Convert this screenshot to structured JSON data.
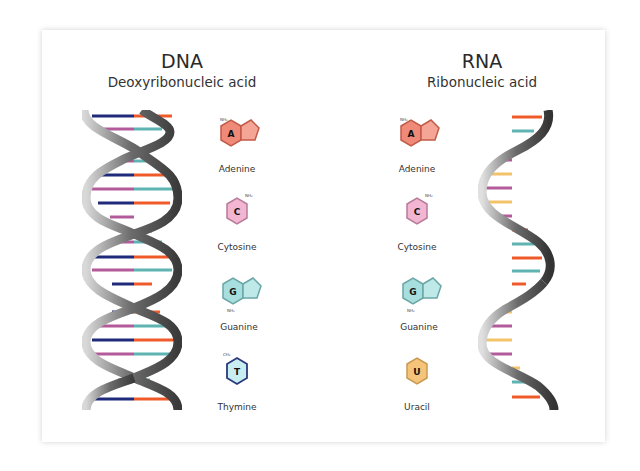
{
  "dna": {
    "title": "DNA",
    "subtitle": "Deoxyribonucleic acid",
    "bases": [
      {
        "letter": "A",
        "name": "Adenine",
        "color": "#f08a78",
        "shape": "purine"
      },
      {
        "letter": "C",
        "name": "Cytosine",
        "color": "#f2b6d2",
        "shape": "pyrimidine"
      },
      {
        "letter": "G",
        "name": "Guanine",
        "color": "#a9dede",
        "shape": "purine"
      },
      {
        "letter": "T",
        "name": "Thymine",
        "color": "#c9eef2",
        "shape": "pyrimidine"
      }
    ]
  },
  "rna": {
    "title": "RNA",
    "subtitle": "Ribonucleic acid",
    "bases": [
      {
        "letter": "A",
        "name": "Adenine",
        "color": "#f08a78",
        "shape": "purine"
      },
      {
        "letter": "C",
        "name": "Cytosine",
        "color": "#f2b6d2",
        "shape": "pyrimidine"
      },
      {
        "letter": "G",
        "name": "Guanine",
        "color": "#a9dede",
        "shape": "purine"
      },
      {
        "letter": "U",
        "name": "Uracil",
        "color": "#f5c37a",
        "shape": "pyrimidine"
      }
    ]
  },
  "colors": {
    "adenine": "#f05a2a",
    "thymine": "#1f2a7a",
    "cytosine": "#b35a9a",
    "guanine": "#5fb3b3",
    "uracil": "#f3c36a",
    "backbone": "#6e6e6e"
  }
}
